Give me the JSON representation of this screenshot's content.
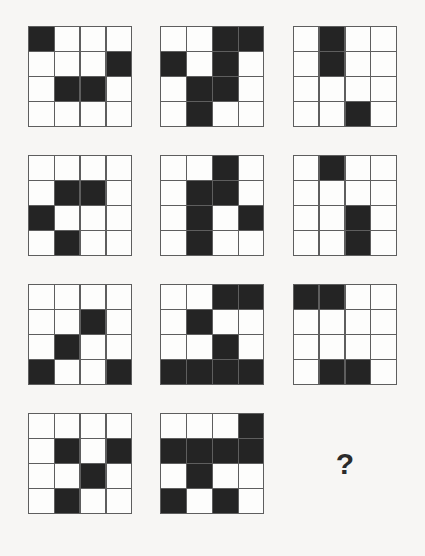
{
  "puzzle": {
    "type": "matrix-reasoning-grid-puzzle",
    "rows": 4,
    "columns": 3,
    "cell_grid_size": 4,
    "missing_cell_index": 11,
    "missing_cell_label": "?",
    "colors": {
      "background": "#f7f6f4",
      "grid_line": "#5e5e5e",
      "filled_square": "#242424",
      "empty_square": "#fdfdfc",
      "question_mark": "#2b2b2b"
    },
    "panels": [
      {
        "index": 0,
        "name": "panel-r1c1",
        "grid": [
          [
            1,
            0,
            0,
            0
          ],
          [
            0,
            0,
            0,
            1
          ],
          [
            0,
            1,
            1,
            0
          ],
          [
            0,
            0,
            0,
            0
          ]
        ]
      },
      {
        "index": 1,
        "name": "panel-r1c2",
        "grid": [
          [
            0,
            0,
            1,
            1
          ],
          [
            1,
            0,
            1,
            0
          ],
          [
            0,
            1,
            1,
            0
          ],
          [
            0,
            1,
            0,
            0
          ]
        ]
      },
      {
        "index": 2,
        "name": "panel-r1c3",
        "grid": [
          [
            0,
            1,
            0,
            0
          ],
          [
            0,
            1,
            0,
            0
          ],
          [
            0,
            0,
            0,
            0
          ],
          [
            0,
            0,
            1,
            0
          ]
        ]
      },
      {
        "index": 3,
        "name": "panel-r2c1",
        "grid": [
          [
            0,
            0,
            0,
            0
          ],
          [
            0,
            1,
            1,
            0
          ],
          [
            1,
            0,
            0,
            0
          ],
          [
            0,
            1,
            0,
            0
          ]
        ]
      },
      {
        "index": 4,
        "name": "panel-r2c2",
        "grid": [
          [
            0,
            0,
            1,
            0
          ],
          [
            0,
            1,
            1,
            0
          ],
          [
            0,
            1,
            0,
            1
          ],
          [
            0,
            1,
            0,
            0
          ]
        ]
      },
      {
        "index": 5,
        "name": "panel-r2c3",
        "grid": [
          [
            0,
            1,
            0,
            0
          ],
          [
            0,
            0,
            0,
            0
          ],
          [
            0,
            0,
            1,
            0
          ],
          [
            0,
            0,
            1,
            0
          ]
        ]
      },
      {
        "index": 6,
        "name": "panel-r3c1",
        "grid": [
          [
            0,
            0,
            0,
            0
          ],
          [
            0,
            0,
            1,
            0
          ],
          [
            0,
            1,
            0,
            0
          ],
          [
            1,
            0,
            0,
            1
          ]
        ]
      },
      {
        "index": 7,
        "name": "panel-r3c2",
        "grid": [
          [
            0,
            0,
            1,
            1
          ],
          [
            0,
            1,
            0,
            0
          ],
          [
            0,
            0,
            1,
            0
          ],
          [
            1,
            1,
            1,
            1
          ]
        ]
      },
      {
        "index": 8,
        "name": "panel-r3c3",
        "grid": [
          [
            1,
            1,
            0,
            0
          ],
          [
            0,
            0,
            0,
            0
          ],
          [
            0,
            0,
            0,
            0
          ],
          [
            0,
            1,
            1,
            0
          ]
        ]
      },
      {
        "index": 9,
        "name": "panel-r4c1",
        "grid": [
          [
            0,
            0,
            0,
            0
          ],
          [
            0,
            1,
            0,
            1
          ],
          [
            0,
            0,
            1,
            0
          ],
          [
            0,
            1,
            0,
            0
          ]
        ]
      },
      {
        "index": 10,
        "name": "panel-r4c2",
        "grid": [
          [
            0,
            0,
            0,
            1
          ],
          [
            1,
            1,
            1,
            1
          ],
          [
            0,
            1,
            0,
            0
          ],
          [
            1,
            0,
            1,
            0
          ]
        ]
      },
      {
        "index": 11,
        "name": "panel-r4c3-missing",
        "grid": null
      }
    ]
  }
}
